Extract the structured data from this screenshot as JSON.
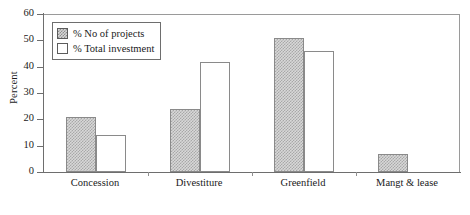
{
  "chart_data": {
    "type": "bar",
    "title": "",
    "xlabel": "",
    "ylabel": "Percent",
    "ylim": [
      0,
      60
    ],
    "yticks": [
      0,
      10,
      20,
      30,
      40,
      50,
      60
    ],
    "grid": false,
    "legend_position": "upper-left-inside",
    "categories": [
      "Concession",
      "Divestiture",
      "Greenfield",
      "Mangt & lease"
    ],
    "series": [
      {
        "name": "% No of projects",
        "values": [
          20.8,
          24.0,
          50.8,
          6.8
        ]
      },
      {
        "name": "% Total investment",
        "values": [
          14.0,
          41.8,
          45.8,
          0.0
        ]
      }
    ]
  },
  "legend": {
    "items": [
      {
        "label": "% No of projects",
        "swatch": "hatched-swatch"
      },
      {
        "label": "% Total investment",
        "swatch": "white-swatch"
      }
    ]
  },
  "axes": {
    "y_title": "Percent",
    "y_tick_labels": [
      "60",
      "50",
      "40",
      "30",
      "20",
      "10",
      "0"
    ],
    "x_tick_labels": [
      "Concession",
      "Divestiture",
      "Greenfield",
      "Mangt & lease"
    ]
  },
  "colors": {
    "series_1_fill": "#d8d8d8",
    "series_1_hatch": "#a8a8a8",
    "series_2_fill": "#ffffff",
    "bar_outline": "#8a8a8a",
    "axis": "#6e6e6e",
    "frame": "#9a9a9a",
    "text": "#1a1a1a",
    "background": "#ffffff"
  }
}
